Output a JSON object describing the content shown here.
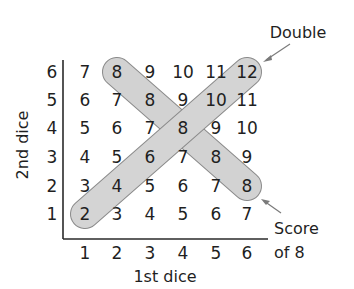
{
  "diagram": {
    "type": "dice-sum-table",
    "x_axis_title": "1st dice",
    "y_axis_title": "2nd dice",
    "x_ticks": [
      "1",
      "2",
      "3",
      "4",
      "5",
      "6"
    ],
    "y_ticks": [
      "6",
      "5",
      "4",
      "3",
      "2",
      "1"
    ],
    "rows": [
      [
        "7",
        "8",
        "9",
        "10",
        "11",
        "12"
      ],
      [
        "6",
        "7",
        "8",
        "9",
        "10",
        "11"
      ],
      [
        "5",
        "6",
        "7",
        "8",
        "9",
        "10"
      ],
      [
        "4",
        "5",
        "6",
        "7",
        "8",
        "9"
      ],
      [
        "3",
        "4",
        "5",
        "6",
        "7",
        "8"
      ],
      [
        "2",
        "3",
        "4",
        "5",
        "6",
        "7"
      ]
    ],
    "annotations": {
      "double": {
        "label": "Double",
        "description": "diagonal from (1,1)=2 to (6,6)=12"
      },
      "score8": {
        "label_line1": "Score",
        "label_line2": "of 8",
        "description": "diagonal from (2,6)=8 to (6,2)=8"
      }
    },
    "colors": {
      "highlight_fill": "#d6d6d6",
      "highlight_stroke": "#8a8a8a",
      "text": "#1f1f1f",
      "arrow": "#7a7a7a"
    }
  }
}
